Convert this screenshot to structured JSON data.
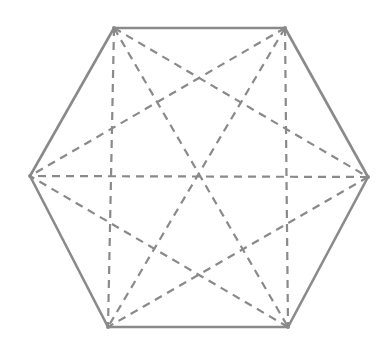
{
  "diagram": {
    "title": "",
    "shape": "regular-hexagon-with-all-diagonals",
    "stroke_color": "#8a8a8a",
    "background": "#ffffff",
    "edge_style": "solid",
    "diagonal_style": "dashed",
    "vertices": [
      {
        "id": "A",
        "x": 114,
        "y": 28
      },
      {
        "id": "B",
        "x": 285,
        "y": 28
      },
      {
        "id": "C",
        "x": 368,
        "y": 177
      },
      {
        "id": "D",
        "x": 288,
        "y": 327
      },
      {
        "id": "E",
        "x": 108,
        "y": 327
      },
      {
        "id": "F",
        "x": 30,
        "y": 176
      }
    ],
    "edges": [
      [
        "A",
        "B"
      ],
      [
        "B",
        "C"
      ],
      [
        "C",
        "D"
      ],
      [
        "D",
        "E"
      ],
      [
        "E",
        "F"
      ],
      [
        "F",
        "A"
      ]
    ],
    "diagonals": [
      [
        "A",
        "C"
      ],
      [
        "A",
        "D"
      ],
      [
        "A",
        "E"
      ],
      [
        "B",
        "D"
      ],
      [
        "B",
        "E"
      ],
      [
        "B",
        "F"
      ],
      [
        "C",
        "E"
      ],
      [
        "C",
        "F"
      ],
      [
        "D",
        "F"
      ]
    ]
  }
}
